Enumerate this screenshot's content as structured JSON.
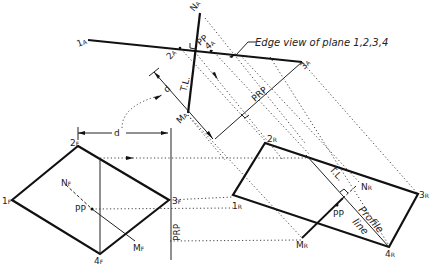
{
  "diagram": {
    "callout": "Edge view of plane 1,2,3,4",
    "auxiliary_view": {
      "points": {
        "p1": "1",
        "p2": "2",
        "p3": "3",
        "p4": "4",
        "sub": "A"
      },
      "n": "N",
      "m": "M",
      "sub": "A",
      "pp": "PP",
      "tl": "T.L.",
      "d": "d",
      "prp": "PRP"
    },
    "front_view": {
      "points": {
        "p1": "1",
        "p2": "2",
        "p3": "3",
        "p4": "4",
        "sub": "F"
      },
      "n": "N",
      "m": "M",
      "sub": "F",
      "pp": "PP",
      "d": "d",
      "prp": "PRP"
    },
    "right_view": {
      "points": {
        "p1": "1",
        "p2": "2",
        "p3": "3",
        "p4": "4",
        "sub": "R"
      },
      "n": "N",
      "m": "M",
      "sub": "R",
      "pp": "PP",
      "tl": "T.L.",
      "profile_line": "Profile",
      "profile_line_2": "line"
    }
  }
}
